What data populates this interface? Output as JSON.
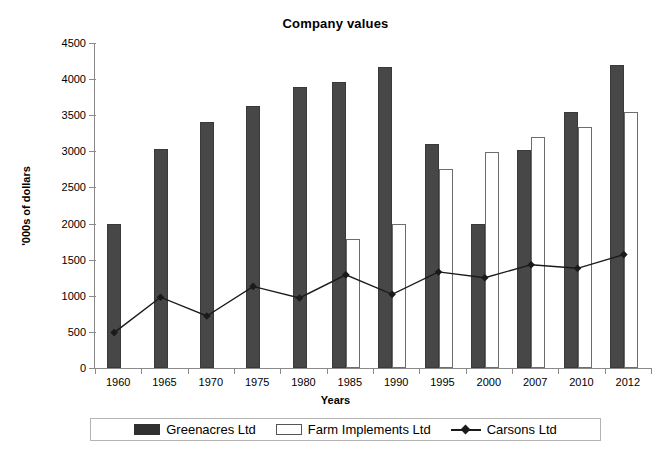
{
  "chart_data": {
    "type": "bar",
    "title": "Company values",
    "xlabel": "Years",
    "ylabel": "'000s of dollars",
    "categories": [
      "1960",
      "1965",
      "1970",
      "1975",
      "1980",
      "1985",
      "1990",
      "1995",
      "2000",
      "2007",
      "2010",
      "2012"
    ],
    "ylim": [
      0,
      4500
    ],
    "yticks": [
      0,
      500,
      1000,
      1500,
      2000,
      2500,
      3000,
      3500,
      4000,
      4500
    ],
    "ytick_labels": [
      "0",
      "500",
      "1000",
      "1500",
      "2000",
      "2500",
      "3000",
      "3500",
      "4000",
      "4500"
    ],
    "grid": false,
    "legend_position": "bottom",
    "series": [
      {
        "name": "Greenacres Ltd",
        "kind": "bar",
        "color": "#474747",
        "values": [
          2000,
          3030,
          3400,
          3630,
          3890,
          3960,
          4170,
          3100,
          2000,
          3020,
          3540,
          4190
        ]
      },
      {
        "name": "Farm Implements Ltd",
        "kind": "bar",
        "color": "#ffffff",
        "values": [
          null,
          null,
          null,
          null,
          null,
          1780,
          2000,
          2760,
          2990,
          3200,
          3340,
          3550
        ]
      },
      {
        "name": "Carsons Ltd",
        "kind": "line",
        "color": "#1a1a1a",
        "marker": "diamond",
        "values": [
          490,
          980,
          720,
          1130,
          970,
          1290,
          1020,
          1330,
          1250,
          1430,
          1380,
          1570
        ]
      }
    ]
  },
  "legend": {
    "items": [
      {
        "label": "Greenacres Ltd",
        "style": "filled"
      },
      {
        "label": "Farm Implements Ltd",
        "style": "outline"
      },
      {
        "label": "Carsons Ltd",
        "style": "lineMarker"
      }
    ]
  }
}
